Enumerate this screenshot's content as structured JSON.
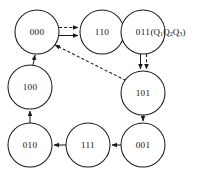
{
  "diagram": {
    "kind": "state-transition-diagram",
    "legend": {
      "prefix": "(Q",
      "sub1": "1",
      "mid1": "Q",
      "sub2": "2",
      "mid2": "Q",
      "sub3": "3",
      "suffix": ")",
      "full_text": "(Q1Q2Q3)"
    },
    "nodes": [
      {
        "id": "n000",
        "label": "000",
        "cx": 37,
        "cy": 32,
        "r": 22
      },
      {
        "id": "n110",
        "label": "110",
        "cx": 102,
        "cy": 32,
        "r": 22
      },
      {
        "id": "n011",
        "label": "011",
        "cx": 143,
        "cy": 32,
        "r": 22
      },
      {
        "id": "n101",
        "label": "101",
        "cx": 143,
        "cy": 93,
        "r": 22
      },
      {
        "id": "n001",
        "label": "001",
        "cx": 143,
        "cy": 145,
        "r": 22
      },
      {
        "id": "n111",
        "label": "111",
        "cx": 88,
        "cy": 145,
        "r": 22
      },
      {
        "id": "n010",
        "label": "010",
        "cx": 30,
        "cy": 145,
        "r": 22
      },
      {
        "id": "n100",
        "label": "100",
        "cx": 30,
        "cy": 87,
        "r": 22
      }
    ],
    "edges": [
      {
        "id": "e-000-110-dashed",
        "from": "000",
        "to": "110",
        "style": "dashed",
        "name": "edge-000-to-110-dashed"
      },
      {
        "id": "e-000-110-solid",
        "from": "000",
        "to": "110",
        "style": "solid",
        "name": "edge-000-to-110-solid"
      },
      {
        "id": "e-110-011-dashed",
        "from": "110",
        "to": "011",
        "style": "dashed",
        "name": "edge-110-to-011-dashed"
      },
      {
        "id": "e-110-011-solid",
        "from": "110",
        "to": "011",
        "style": "solid",
        "name": "edge-110-to-011-solid"
      },
      {
        "id": "e-011-101-dashed",
        "from": "011",
        "to": "101",
        "style": "dashed",
        "name": "edge-011-to-101-dashed"
      },
      {
        "id": "e-011-101-solid",
        "from": "011",
        "to": "101",
        "style": "solid",
        "name": "edge-011-to-101-solid"
      },
      {
        "id": "e-101-001",
        "from": "101",
        "to": "001",
        "style": "solid",
        "name": "edge-101-to-001"
      },
      {
        "id": "e-001-111",
        "from": "001",
        "to": "111",
        "style": "solid",
        "name": "edge-001-to-111"
      },
      {
        "id": "e-111-010",
        "from": "111",
        "to": "010",
        "style": "solid",
        "name": "edge-111-to-010"
      },
      {
        "id": "e-010-100",
        "from": "010",
        "to": "100",
        "style": "solid",
        "name": "edge-010-to-100"
      },
      {
        "id": "e-100-000",
        "from": "100",
        "to": "000",
        "style": "solid",
        "name": "edge-100-to-000"
      },
      {
        "id": "e-101-000-dashed",
        "from": "101",
        "to": "000",
        "style": "dashed",
        "name": "edge-101-to-000-dashed"
      }
    ],
    "colors": {
      "stroke": "#1a1a1a",
      "node_fill": "#ffffff",
      "background": "#ffffff",
      "text": "#111111"
    }
  }
}
